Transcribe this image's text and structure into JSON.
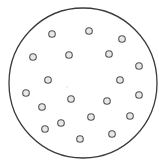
{
  "diagram": {
    "outer_circle": {
      "cx": 83,
      "cy": 83,
      "r": 74,
      "stroke": "#3a3a3a"
    },
    "dot_style": {
      "r": 3.3,
      "stroke": "#555555",
      "fill": "#e8e8e8"
    },
    "dots": [
      {
        "x": 52,
        "y": 34
      },
      {
        "x": 89,
        "y": 31
      },
      {
        "x": 122,
        "y": 39
      },
      {
        "x": 33,
        "y": 57
      },
      {
        "x": 69,
        "y": 55
      },
      {
        "x": 109,
        "y": 54
      },
      {
        "x": 139,
        "y": 66
      },
      {
        "x": 48,
        "y": 80
      },
      {
        "x": 120,
        "y": 80
      },
      {
        "x": 26,
        "y": 93
      },
      {
        "x": 71,
        "y": 99
      },
      {
        "x": 107,
        "y": 101
      },
      {
        "x": 139,
        "y": 95
      },
      {
        "x": 42,
        "y": 107
      },
      {
        "x": 91,
        "y": 117
      },
      {
        "x": 130,
        "y": 116
      },
      {
        "x": 61,
        "y": 123
      },
      {
        "x": 45,
        "y": 129
      },
      {
        "x": 80,
        "y": 139
      },
      {
        "x": 112,
        "y": 134
      }
    ],
    "center_mark": {
      "x": 67,
      "y": 87
    }
  }
}
